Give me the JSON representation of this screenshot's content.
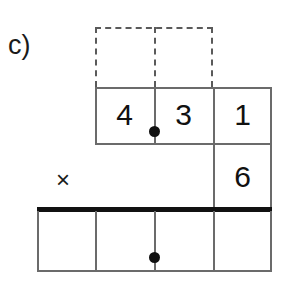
{
  "figure": {
    "part_label": "c)",
    "operator_symbol": "×"
  },
  "colors": {
    "grid_line": "#6b6b6b",
    "dashed_line": "#5a5a5a",
    "thick_rule": "#111111",
    "digit_text": "#111111",
    "label_text": "#1a1a1a",
    "background": "#ffffff"
  },
  "carry_row": {
    "name": "dashed-carry-row",
    "cells": [
      {
        "value": ""
      },
      {
        "value": ""
      }
    ]
  },
  "top_row": {
    "name": "multiplicand-row",
    "cells": [
      {
        "label": "cell-4",
        "value": "4"
      },
      {
        "label": "cell-3",
        "value": "3"
      },
      {
        "label": "cell-1",
        "value": "1"
      }
    ]
  },
  "multiplier_row": {
    "name": "multiplier-row",
    "cells": [
      {
        "label": "cell-empty",
        "value": ""
      },
      {
        "label": "cell-6",
        "value": "6"
      }
    ]
  },
  "answer_row": {
    "name": "answer-row",
    "cells": [
      {
        "label": "answer-cell-1",
        "value": ""
      },
      {
        "label": "answer-cell-2",
        "value": ""
      },
      {
        "label": "answer-cell-3",
        "value": ""
      },
      {
        "label": "answer-cell-4",
        "value": ""
      }
    ]
  },
  "markers": [
    {
      "name": "decimal-point-dot-top",
      "value": ""
    },
    {
      "name": "decimal-point-dot-bottom",
      "value": ""
    }
  ]
}
